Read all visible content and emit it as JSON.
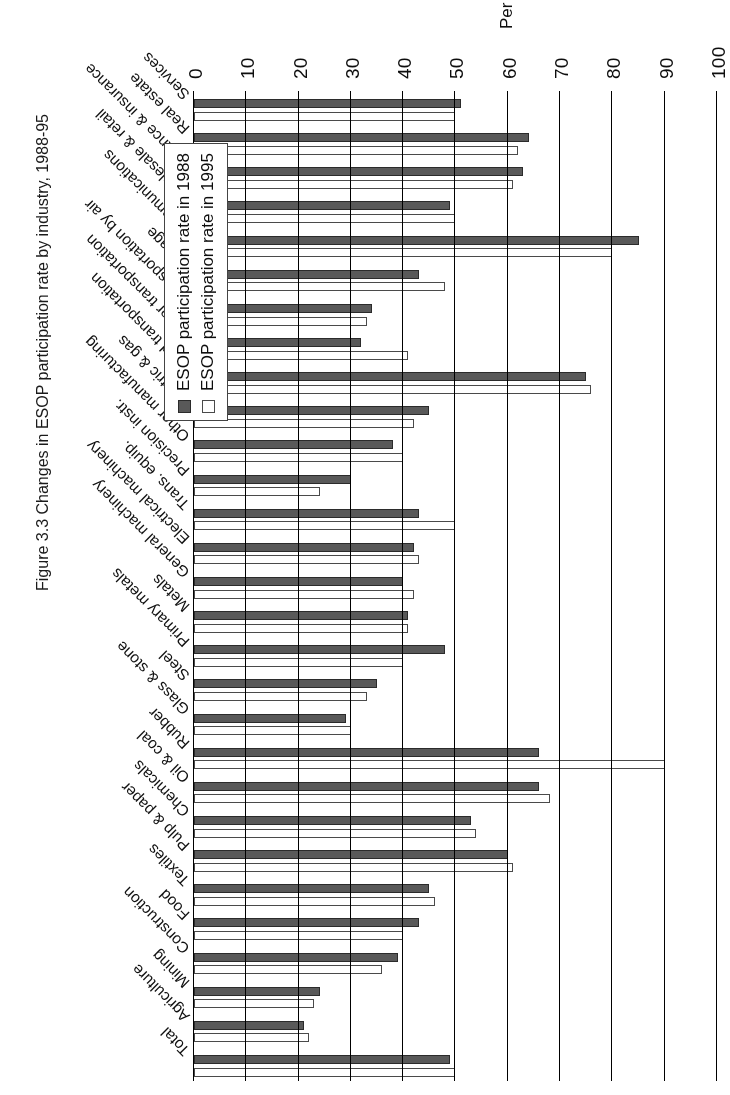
{
  "chart_data": {
    "type": "bar",
    "orientation": "horizontal",
    "title": "",
    "xlabel": "",
    "ylabel": "Per cent",
    "ylim": [
      0,
      100
    ],
    "ticks": [
      "0",
      "10",
      "20",
      "30",
      "40",
      "50",
      "60",
      "70",
      "80",
      "90",
      "100"
    ],
    "grid": true,
    "legend_position": "bottom-right",
    "categories": [
      "Total",
      "Agriculture",
      "Mining",
      "Construction",
      "Food",
      "Textiles",
      "Pulp & paper",
      "Chemicals",
      "Oil & coal",
      "Rubber",
      "Glass & stone",
      "Steel",
      "Primary metals",
      "Metals",
      "General machinery",
      "Electrical machinery",
      "Trans. equip.",
      "Precision instr.",
      "Other manufacturing",
      "Electric & gas",
      "Land transportation",
      "Water transportation",
      "Transportation by air",
      "Storage",
      "Communications",
      "Wholesale & retail",
      "Finance & insurance",
      "Real estate",
      "Services"
    ],
    "series": [
      {
        "name": "ESOP participation rate in 1988",
        "color": "#595959",
        "values": [
          49,
          21,
          24,
          39,
          43,
          45,
          60,
          53,
          66,
          66,
          29,
          35,
          48,
          41,
          40,
          42,
          43,
          30,
          38,
          45,
          75,
          32,
          34,
          43,
          85,
          49,
          63,
          64,
          51
        ]
      },
      {
        "name": "ESOP participation rate in 1995",
        "color": "#ffffff",
        "values": [
          50,
          22,
          23,
          36,
          40,
          46,
          61,
          54,
          68,
          90,
          30,
          33,
          40,
          41,
          42,
          43,
          50,
          24,
          40,
          42,
          76,
          41,
          33,
          48,
          80,
          50,
          61,
          62,
          50
        ]
      }
    ]
  },
  "axis": {
    "value_axis_title": "Per cent"
  },
  "legend": {
    "items": [
      {
        "label": "ESOP participation rate in 1988",
        "swatch": "dark"
      },
      {
        "label": "ESOP participation rate in 1995",
        "swatch": "light"
      }
    ]
  },
  "caption": {
    "text": "Figure 3.3  Changes in ESOP participation rate by industry, 1988-95"
  }
}
